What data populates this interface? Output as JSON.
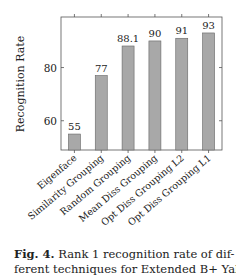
{
  "chart_data": {
    "type": "bar",
    "title": "",
    "xlabel": "",
    "ylabel": "Recognition Rate",
    "categories": [
      "Eigenface",
      "Similarity Grouping",
      "Random Grouping",
      "Mean Diss Grouping",
      "Opt Diss Grouping L2",
      "Opt Diss Grouping L1"
    ],
    "values": [
      55,
      77,
      88.1,
      90,
      91,
      93
    ],
    "data_labels": [
      "55",
      "77",
      "88.1",
      "90",
      "91",
      "93"
    ],
    "yticks": [
      60,
      80
    ],
    "ylim": [
      49,
      99
    ],
    "grid": false,
    "legend": null,
    "bar_color": "#a8a8a8",
    "bar_edge_color": "#666666"
  },
  "caption": {
    "label": "Fig. 4.",
    "line1": " Rank 1 recognition rate of dif-",
    "line2": "ferent techniques for Extended B+ Yale"
  }
}
